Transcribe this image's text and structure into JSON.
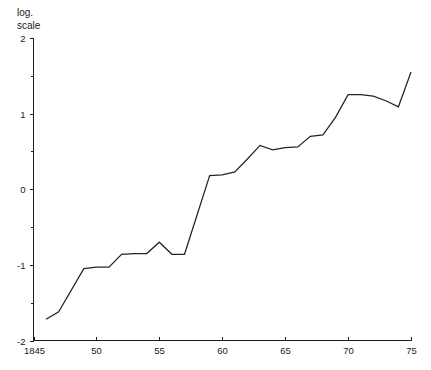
{
  "chart_data": {
    "type": "line",
    "title": "",
    "subtitle": "",
    "ylabel_lines": [
      "log.",
      "scale"
    ],
    "xlabel": "",
    "ylabel": "log. scale",
    "xlim": [
      1845,
      1875
    ],
    "ylim": [
      -2,
      2
    ],
    "grid": false,
    "legend": null,
    "x_tick_labels": [
      "1845",
      "50",
      "55",
      "60",
      "65",
      "70",
      "75"
    ],
    "x_tick_values": [
      1845,
      1850,
      1855,
      1860,
      1865,
      1870,
      1875
    ],
    "y_tick_labels": [
      "2",
      "1",
      "0",
      "-1",
      "-2"
    ],
    "y_tick_values": [
      2,
      1,
      0,
      -1,
      -2
    ],
    "y_minor_tick_values": [
      1.5,
      0.5,
      -0.5,
      -1.5
    ],
    "series": [
      {
        "name": "log. scale series",
        "x": [
          1846,
          1847,
          1849,
          1850,
          1851,
          1852,
          1853,
          1854,
          1855,
          1856,
          1857,
          1859,
          1860,
          1861,
          1862,
          1863,
          1864,
          1865,
          1866,
          1867,
          1868,
          1869,
          1870,
          1871,
          1872,
          1873,
          1874,
          1875
        ],
        "values": [
          -1.72,
          -1.62,
          -1.05,
          -1.03,
          -1.03,
          -0.86,
          -0.85,
          -0.85,
          -0.7,
          -0.86,
          -0.86,
          0.18,
          0.19,
          0.23,
          0.4,
          0.58,
          0.52,
          0.55,
          0.56,
          0.7,
          0.72,
          0.95,
          1.25,
          1.25,
          1.23,
          1.17,
          1.09,
          1.55
        ]
      }
    ]
  },
  "axis_title": {
    "line1": "log.",
    "line2": "scale"
  }
}
